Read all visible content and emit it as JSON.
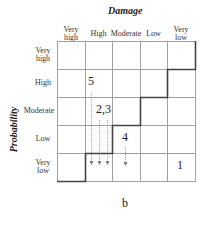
{
  "diagram": {
    "x_axis_title": "Damage",
    "y_axis_title": "Probability",
    "caption": "b",
    "columns": [
      "Very high",
      "High",
      "Moderate",
      "Low",
      "Very low"
    ],
    "rows": [
      "Very high",
      "High",
      "Moderate",
      "Low",
      "Very low"
    ],
    "column_labels": [
      {
        "line1": "Very",
        "line2": "high"
      },
      {
        "line1": "High",
        "line2": ""
      },
      {
        "line1": "Moderate",
        "line2": ""
      },
      {
        "line1": "Low",
        "line2": ""
      },
      {
        "line1": "Very",
        "line2": "low"
      }
    ],
    "row_labels": [
      {
        "line1": "Very",
        "line2": "high"
      },
      {
        "line1": "High",
        "line2": ""
      },
      {
        "line1": "Moderate",
        "line2": ""
      },
      {
        "line1": "Low",
        "line2": ""
      },
      {
        "line1": "Very",
        "line2": "low"
      }
    ],
    "markers": [
      {
        "label": "5",
        "row": "High",
        "column": "High",
        "arrow_to": "Very low"
      },
      {
        "label": "2,3",
        "row": "Moderate",
        "column": "High",
        "arrow_to": "Very low"
      },
      {
        "label": "4",
        "row": "Low",
        "column": "Moderate",
        "arrow_to": "Very low"
      },
      {
        "label": "1",
        "row": "Very low",
        "column": "Very low",
        "arrow_to": null
      }
    ],
    "colors": {
      "grid": "#9a9a9a",
      "boundary": "#444444",
      "arrow": "#777777"
    }
  }
}
